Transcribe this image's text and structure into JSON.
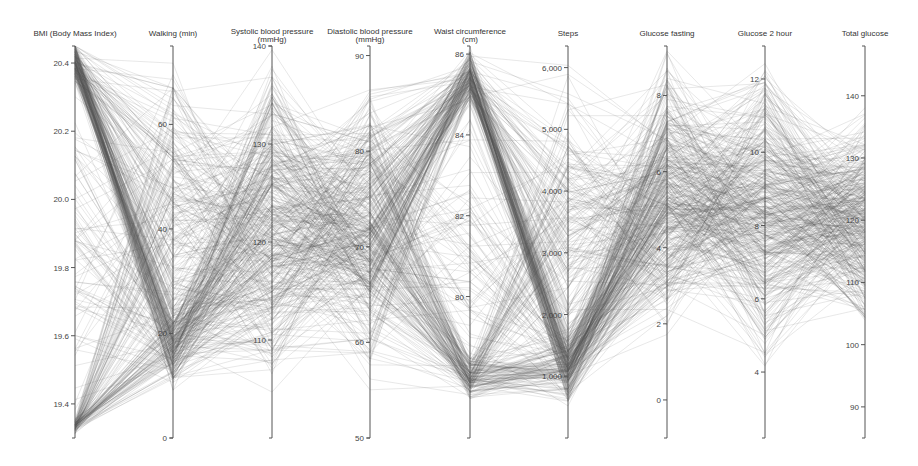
{
  "chart_data": {
    "type": "parallel_coordinates",
    "title": "",
    "line_color": "#5a5a5a",
    "axis_color": "#555555",
    "n_records": 420,
    "plot_top": 46,
    "plot_bottom": 438,
    "axes": [
      {
        "label": "BMI (Body Mass Index)",
        "label2": "",
        "x": 75,
        "min": 19.3,
        "max": 20.45,
        "ticks": [
          19.4,
          19.6,
          19.8,
          20.0,
          20.2,
          20.4
        ],
        "tick_labels": [
          "19.4",
          "19.6",
          "19.8",
          "20.0",
          "20.2",
          "20.4"
        ]
      },
      {
        "label": "Walking (min)",
        "label2": "",
        "x": 173,
        "min": 0,
        "max": 75,
        "ticks": [
          0,
          20,
          40,
          60
        ],
        "tick_labels": [
          "0",
          "20",
          "40",
          "60"
        ]
      },
      {
        "label": "Systolic blood pressure",
        "label2": "(mmHg)",
        "x": 272,
        "min": 100,
        "max": 140,
        "ticks": [
          110,
          120,
          130,
          140
        ],
        "tick_labels": [
          "110",
          "120",
          "130",
          "140"
        ]
      },
      {
        "label": "Diastolic blood pressure",
        "label2": "(mmHg)",
        "x": 370,
        "min": 50,
        "max": 91,
        "ticks": [
          50,
          60,
          70,
          80,
          90
        ],
        "tick_labels": [
          "50",
          "60",
          "70",
          "80",
          "90"
        ]
      },
      {
        "label": "Waist circumference",
        "label2": "(cm)",
        "x": 470,
        "min": 76.5,
        "max": 86.2,
        "ticks": [
          80,
          82,
          84,
          86
        ],
        "tick_labels": [
          "80",
          "82",
          "84",
          "86"
        ]
      },
      {
        "label": "Steps",
        "label2": "",
        "x": 568,
        "min": 0,
        "max": 6350,
        "ticks": [
          1000,
          2000,
          3000,
          4000,
          5000,
          6000
        ],
        "tick_labels": [
          "1,000",
          "2,000",
          "3,000",
          "4,000",
          "5,000",
          "6,000"
        ]
      },
      {
        "label": "Glucose fasting",
        "label2": "",
        "x": 667,
        "min": -1,
        "max": 9.3,
        "ticks": [
          0,
          2,
          4,
          6,
          8
        ],
        "tick_labels": [
          "0",
          "2",
          "4",
          "6",
          "8"
        ]
      },
      {
        "label": "Glucose 2 hour",
        "label2": "",
        "x": 765,
        "min": 2.2,
        "max": 12.9,
        "ticks": [
          4,
          6,
          8,
          10,
          12
        ],
        "tick_labels": [
          "4",
          "6",
          "8",
          "10",
          "12"
        ]
      },
      {
        "label": "Total glucose",
        "label2": "",
        "x": 865,
        "min": 85,
        "max": 148,
        "ticks": [
          90,
          100,
          110,
          120,
          130,
          140
        ],
        "tick_labels": [
          "90",
          "100",
          "110",
          "120",
          "130",
          "140"
        ]
      }
    ],
    "distributions": [
      {
        "axis": "BMI (Body Mass Index)",
        "clusters": [
          {
            "w": 0.55,
            "center": 0.96,
            "spread": 0.06
          },
          {
            "w": 0.25,
            "center": 0.03,
            "spread": 0.02
          },
          {
            "w": 0.2,
            "center": 0.5,
            "spread": 0.45
          }
        ]
      },
      {
        "axis": "Walking (min)",
        "clusters": [
          {
            "w": 0.55,
            "center": 0.24,
            "spread": 0.12
          },
          {
            "w": 0.45,
            "center": 0.55,
            "spread": 0.45
          }
        ]
      },
      {
        "axis": "Systolic blood pressure",
        "clusters": [
          {
            "w": 1.0,
            "center": 0.55,
            "spread": 0.45
          }
        ]
      },
      {
        "axis": "Diastolic blood pressure",
        "clusters": [
          {
            "w": 1.0,
            "center": 0.52,
            "spread": 0.4
          }
        ]
      },
      {
        "axis": "Waist circumference",
        "clusters": [
          {
            "w": 0.45,
            "center": 0.92,
            "spread": 0.08
          },
          {
            "w": 0.35,
            "center": 0.15,
            "spread": 0.06
          },
          {
            "w": 0.2,
            "center": 0.5,
            "spread": 0.45
          }
        ]
      },
      {
        "axis": "Steps",
        "clusters": [
          {
            "w": 0.6,
            "center": 0.18,
            "spread": 0.1
          },
          {
            "w": 0.4,
            "center": 0.55,
            "spread": 0.45
          }
        ]
      },
      {
        "axis": "Glucose fasting",
        "clusters": [
          {
            "w": 1.0,
            "center": 0.62,
            "spread": 0.38
          }
        ]
      },
      {
        "axis": "Glucose 2 hour",
        "clusters": [
          {
            "w": 1.0,
            "center": 0.58,
            "spread": 0.4
          }
        ]
      },
      {
        "axis": "Total glucose",
        "clusters": [
          {
            "w": 1.0,
            "center": 0.55,
            "spread": 0.3
          }
        ]
      }
    ],
    "grid": false,
    "legend": "none"
  }
}
